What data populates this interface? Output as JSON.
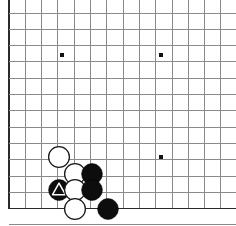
{
  "app": {
    "title": "Go Board Diagram",
    "description": "Go game position diagram, lower-left corner",
    "board_label": "go-board"
  },
  "board": {
    "background_color": "#ffffff",
    "line_color": "#8a8a8a",
    "edge_line_color": "#2b2b2b",
    "star_point_color": "#111111",
    "origin_x": 9,
    "origin_y": 13,
    "cell_size": 16.3,
    "columns": 14,
    "rows": 13,
    "left_edge_index": 0,
    "bottom_edge_index": 12,
    "cropped_right": true,
    "cropped_top": true
  },
  "star_points": [
    {
      "name": "star-point-left",
      "col": 3.25,
      "row": 2.6,
      "x": 62,
      "y": 55
    },
    {
      "name": "star-point-right",
      "col": 9.3,
      "row": 2.6,
      "x": 161,
      "y": 55
    },
    {
      "name": "star-point-lower-right",
      "col": 9.3,
      "row": 8.8,
      "x": 161,
      "y": 157
    }
  ],
  "stones": [
    {
      "id": 1,
      "color": "white",
      "x": 59,
      "y": 157,
      "radius": 10.4,
      "marker": "none",
      "label": "white-stone-1"
    },
    {
      "id": 2,
      "color": "white",
      "x": 75,
      "y": 174,
      "radius": 10.4,
      "marker": "none",
      "label": "white-stone-2"
    },
    {
      "id": 3,
      "color": "black",
      "x": 92,
      "y": 174,
      "radius": 10.4,
      "marker": "none",
      "label": "black-stone-1"
    },
    {
      "id": 4,
      "color": "black",
      "x": 59,
      "y": 190,
      "radius": 10.4,
      "marker": "triangle",
      "label": "black-stone-marked-triangle"
    },
    {
      "id": 5,
      "color": "white",
      "x": 75,
      "y": 190,
      "radius": 10.4,
      "marker": "none",
      "label": "white-stone-3"
    },
    {
      "id": 6,
      "color": "black",
      "x": 92,
      "y": 190,
      "radius": 10.4,
      "marker": "none",
      "label": "black-stone-2"
    },
    {
      "id": 7,
      "color": "white",
      "x": 75,
      "y": 209,
      "radius": 10.4,
      "marker": "none",
      "label": "white-stone-4"
    },
    {
      "id": 8,
      "color": "black",
      "x": 108,
      "y": 209,
      "radius": 10.4,
      "marker": "none",
      "label": "black-stone-3"
    }
  ],
  "marker": {
    "type": "triangle",
    "color": "#ffffff",
    "meaning": "marked-stone"
  },
  "counts": {
    "black_stones": 3,
    "white_stones": 4,
    "marked_stones": 1,
    "total_stones": 8
  }
}
